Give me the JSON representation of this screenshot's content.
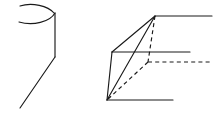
{
  "document": {
    "title": "Geometric Line Drawing",
    "kind": "technical-sketch",
    "background_color": "#ffffff",
    "stroke_color": "#1a1a1a",
    "stroke_width": 1.15,
    "canvas": {
      "width": 222,
      "height": 121
    }
  },
  "figures": [
    {
      "id": "left-figure",
      "name": "partial-cone-sketch",
      "description": "Open elliptical arc at top with a vertical side line bending into a long diagonal",
      "elements": [
        {
          "id": "left-upper-arc",
          "name": "upper-ellipse-arc",
          "style": "solid",
          "path": "M 20 6 C 32 2, 48 6, 54 13"
        },
        {
          "id": "left-lower-arc",
          "name": "lower-ellipse-arc",
          "style": "solid",
          "path": "M 19 22 C 33 26, 50 22, 55 13"
        },
        {
          "id": "left-side-line",
          "name": "cone-side-line",
          "style": "solid",
          "path": "M 55 13 L 55 57"
        },
        {
          "id": "left-diagonal",
          "name": "cone-slant-line",
          "style": "solid",
          "path": "M 55 57 L 20 108"
        }
      ]
    },
    {
      "id": "right-figure",
      "name": "perspective-wedge-sketch",
      "description": "Three-dimensional wedge/prism in perspective with hidden edges shown dashed",
      "vertices": {
        "top_apex": [
          155,
          16
        ],
        "left_mid": [
          112,
          52
        ],
        "bottom_left": [
          107,
          100
        ],
        "hidden_corner": [
          148,
          62
        ]
      },
      "elements": [
        {
          "id": "wedge-top-edge",
          "name": "top-horizontal-edge",
          "style": "solid",
          "path": "M 155 16 L 212 16"
        },
        {
          "id": "wedge-top-left-edge",
          "name": "top-left-slant-edge",
          "style": "solid",
          "path": "M 155 16 L 112 52"
        },
        {
          "id": "wedge-mid-horizontal",
          "name": "middle-horizontal-edge",
          "style": "solid",
          "path": "M 112 52 L 190 52"
        },
        {
          "id": "wedge-left-edge",
          "name": "left-vertical-edge",
          "style": "solid",
          "path": "M 112 52 L 107 100"
        },
        {
          "id": "wedge-bottom-edge",
          "name": "bottom-horizontal-edge",
          "style": "solid",
          "path": "M 107 100 L 173 100"
        },
        {
          "id": "wedge-front-slant",
          "name": "front-slant-edge",
          "style": "solid",
          "path": "M 155 16 L 107 100"
        },
        {
          "id": "wedge-hidden-vertical",
          "name": "hidden-vertical-edge",
          "style": "dashed",
          "path": "M 155 16 L 148 62"
        },
        {
          "id": "wedge-hidden-horizontal",
          "name": "hidden-horizontal-edge",
          "style": "dashed",
          "path": "M 148 62 L 212 62"
        },
        {
          "id": "wedge-hidden-diagonal",
          "name": "hidden-diagonal-edge",
          "style": "dashed",
          "path": "M 148 62 L 107 100"
        }
      ]
    }
  ]
}
